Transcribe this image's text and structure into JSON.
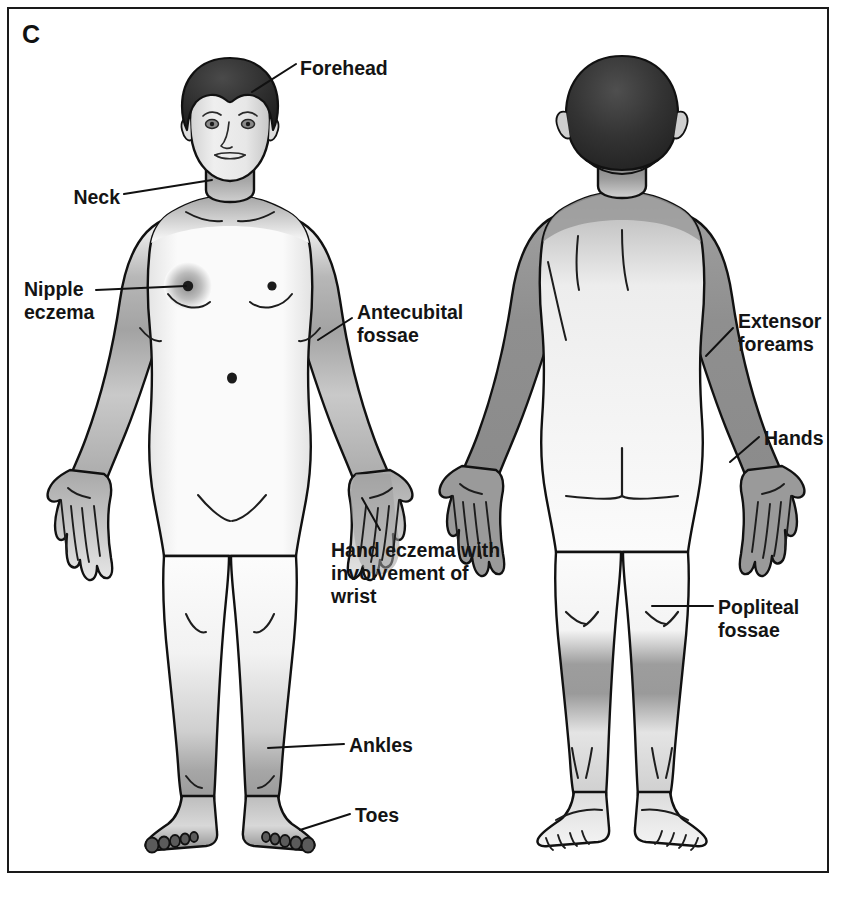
{
  "panel": {
    "letter": "C",
    "border_color": "#1a1a1a",
    "background_color": "#ffffff"
  },
  "illustration": {
    "title": "Atopic dermatitis distribution in adults",
    "views": [
      {
        "name": "anterior-view",
        "label": "front body view",
        "figure": "adult female body, frontal"
      },
      {
        "name": "posterior-view",
        "label": "back body view",
        "figure": "adult female body, dorsal"
      }
    ],
    "ink_color": "#111111",
    "skin_light": "#fbfbfb",
    "shade_color": "#9a9a9a",
    "hair_color": "#3a3a3a"
  },
  "labels": [
    {
      "id": "forehead",
      "text": "Forehead",
      "view": "anterior",
      "align": "left",
      "x": 300,
      "y": 57
    },
    {
      "id": "neck",
      "text": "Neck",
      "view": "anterior",
      "align": "right",
      "x": 70,
      "y": 186
    },
    {
      "id": "nipple",
      "text": "Nipple\neczema",
      "view": "anterior",
      "align": "left",
      "x": 24,
      "y": 278
    },
    {
      "id": "antecubital",
      "text": "Antecubital\nfossae",
      "view": "anterior",
      "align": "left",
      "x": 357,
      "y": 301
    },
    {
      "id": "handeczema",
      "text": "Hand eczema with\ninvolvement of\nwrist",
      "view": "anterior",
      "align": "left",
      "x": 331,
      "y": 539
    },
    {
      "id": "ankles",
      "text": "Ankles",
      "view": "anterior",
      "align": "left",
      "x": 349,
      "y": 734
    },
    {
      "id": "toes",
      "text": "Toes",
      "view": "anterior",
      "align": "left",
      "x": 355,
      "y": 804
    },
    {
      "id": "extensor",
      "text": "Extensor\nforeams",
      "view": "posterior",
      "align": "left",
      "x": 738,
      "y": 310
    },
    {
      "id": "hands",
      "text": "Hands",
      "view": "posterior",
      "align": "left",
      "x": 764,
      "y": 427
    },
    {
      "id": "popliteal",
      "text": "Popliteal\nfossae",
      "view": "posterior",
      "align": "left",
      "x": 718,
      "y": 596
    }
  ],
  "affected_sites": {
    "anterior": [
      "forehead",
      "neck",
      "nipple eczema",
      "antecubital fossae",
      "hand eczema with involvement of wrist",
      "ankles",
      "toes"
    ],
    "posterior": [
      "extensor foreams",
      "hands",
      "popliteal fossae"
    ]
  }
}
